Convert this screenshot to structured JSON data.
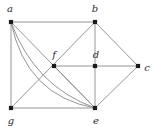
{
  "figure": {
    "type": "undirected-graph-diagram",
    "width": 153,
    "height": 131,
    "background_color": "#ffffff",
    "edge_color": "#8a8a8a",
    "vertex_color": "#1a1a1a",
    "label_color": "#2b2b2b",
    "vertex_radius": 2.1,
    "edge_width": 0.9
  },
  "vertices": [
    {
      "id": "a",
      "label": "a",
      "x": 11,
      "y": 22,
      "label_x": 10,
      "label_y": 9
    },
    {
      "id": "b",
      "label": "b",
      "x": 95,
      "y": 22,
      "label_x": 95,
      "label_y": 9
    },
    {
      "id": "c",
      "label": "c",
      "x": 138,
      "y": 66,
      "label_x": 147,
      "label_y": 68
    },
    {
      "id": "d",
      "label": "d",
      "x": 95,
      "y": 66,
      "label_x": 96,
      "label_y": 55
    },
    {
      "id": "e",
      "label": "e",
      "x": 95,
      "y": 108,
      "label_x": 96,
      "label_y": 121
    },
    {
      "id": "f",
      "label": "f",
      "x": 54,
      "y": 66,
      "label_x": 54,
      "label_y": 55
    },
    {
      "id": "g",
      "label": "g",
      "x": 11,
      "y": 108,
      "label_x": 11,
      "label_y": 121
    }
  ],
  "straight_edges": [
    {
      "name": "edge-a-b",
      "from": "a",
      "to": "b"
    },
    {
      "name": "edge-a-g",
      "from": "a",
      "to": "g"
    },
    {
      "name": "edge-a-e",
      "from": "a",
      "to": "e"
    },
    {
      "name": "edge-g-b",
      "from": "g",
      "to": "b"
    },
    {
      "name": "edge-g-e",
      "from": "g",
      "to": "e"
    },
    {
      "name": "edge-b-d",
      "from": "b",
      "to": "d"
    },
    {
      "name": "edge-b-c",
      "from": "b",
      "to": "c"
    },
    {
      "name": "edge-d-e",
      "from": "d",
      "to": "e"
    },
    {
      "name": "edge-d-c",
      "from": "d",
      "to": "c"
    },
    {
      "name": "edge-e-c",
      "from": "e",
      "to": "c"
    },
    {
      "name": "edge-f-d",
      "from": "f",
      "to": "d"
    },
    {
      "name": "edge-f-e",
      "from": "f",
      "to": "e"
    }
  ],
  "curved_edges": [
    {
      "name": "edge-a-e-arc-outer",
      "from": "a",
      "to": "e",
      "control_x": 26,
      "control_y": 96
    },
    {
      "name": "edge-a-e-arc-inner",
      "from": "a",
      "to": "e",
      "control_x": 34,
      "control_y": 86
    }
  ]
}
